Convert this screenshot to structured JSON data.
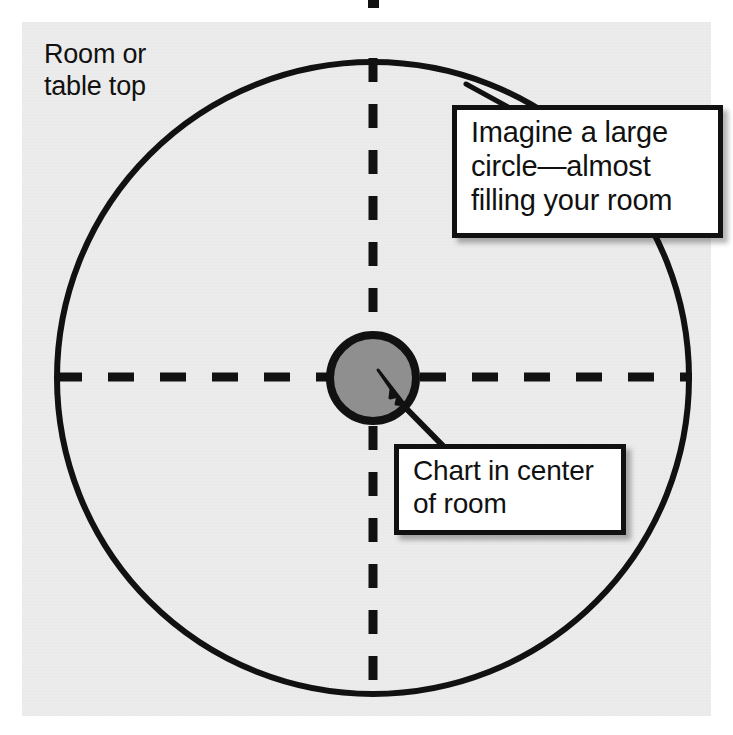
{
  "figure": {
    "background_color": "#ececec",
    "page_color": "#ffffff",
    "ink_color": "#111111"
  },
  "labels": {
    "room_label": {
      "name": "room-or-table-top-label",
      "line1": "Room or",
      "line2": "table top"
    }
  },
  "callouts": {
    "imagine_circle": {
      "name": "imagine-a-large-circle-callout",
      "line1": "Imagine a large",
      "line2": "circle—almost",
      "line3": "filling your room",
      "border_color": "#111111",
      "fill_color": "#ffffff"
    },
    "chart_center": {
      "name": "chart-in-center-of-room-callout",
      "line1": "Chart in center",
      "line2": "of room",
      "border_color": "#111111",
      "fill_color": "#ffffff"
    }
  },
  "shapes": {
    "room_circle": {
      "name": "large-room-circle",
      "cx": 373,
      "cy": 378,
      "r": 316,
      "stroke": "#111111",
      "stroke_width": 6,
      "fill": "none"
    },
    "chart_circle": {
      "name": "chart-circle",
      "cx": 373,
      "cy": 378,
      "r": 43,
      "stroke": "#111111",
      "stroke_width": 7,
      "fill": "#8f8f8f"
    },
    "vertical_axis": {
      "name": "vertical-dashed-axis",
      "x": 373,
      "y1": 58,
      "y2": 700,
      "stroke": "#111111",
      "stroke_width": 9,
      "dash": "24 22"
    },
    "horizontal_axis": {
      "name": "horizontal-dashed-axis",
      "y": 377,
      "x1": 58,
      "x2": 690,
      "stroke": "#111111",
      "stroke_width": 9,
      "dash": "26 26"
    },
    "pointer_arrow": {
      "name": "chart-pointer-arrow",
      "from_x": 452,
      "from_y": 452,
      "to_x": 386,
      "to_y": 388,
      "stroke": "#111111",
      "stroke_width": 6
    },
    "imagine_leader": {
      "name": "imagine-callout-leader-line",
      "from_x": 505,
      "from_y": 105,
      "to_x": 470,
      "to_y": 86,
      "stroke": "#111111",
      "stroke_width": 5
    },
    "top_tick_artifact": {
      "name": "top-edge-artifact",
      "x": 368,
      "y": 0,
      "width": 11,
      "height": 8,
      "fill": "#111111"
    }
  }
}
